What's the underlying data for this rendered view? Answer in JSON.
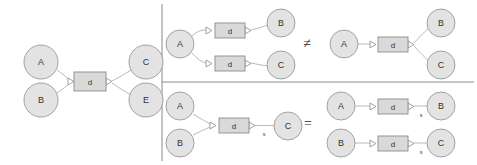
{
  "figure": {
    "background_color": "#ffffff",
    "node_fill": "#e3e3e3",
    "node_stroke": "#9a9a9a",
    "box_fill": "#d9d9d9",
    "box_stroke": "#8c8c8c",
    "edge_stroke": "#a8a8a8"
  },
  "dividers": {
    "vertical_label": "panel-divider-vertical",
    "horizontal_label": "panel-divider-horizontal"
  },
  "panels": [
    {
      "id": "left-panel",
      "name": "many-to-many-hyperedge",
      "nodes": [
        {
          "id": "l-a",
          "label": "A",
          "cx": 41,
          "cy": 62,
          "r": 17
        },
        {
          "id": "l-b",
          "label": "B",
          "cx": 41,
          "cy": 100,
          "r": 17
        },
        {
          "id": "l-c",
          "label": "C",
          "cx": 146,
          "cy": 62,
          "r": 17
        },
        {
          "id": "l-e",
          "label": "E",
          "cx": 146,
          "cy": 100,
          "r": 17
        }
      ],
      "boxes": [
        {
          "id": "l-d",
          "label": "d",
          "x": 74,
          "y": 72,
          "w": 32,
          "h": 19
        }
      ],
      "edges": [
        {
          "id": "l-e1",
          "from": "l-a",
          "to": "l-d",
          "label": ""
        },
        {
          "id": "l-e2",
          "from": "l-b",
          "to": "l-d",
          "label": ""
        },
        {
          "id": "l-e3",
          "from": "l-d",
          "to": "l-c",
          "label": ""
        },
        {
          "id": "l-e4",
          "from": "l-d",
          "to": "l-e",
          "label": ""
        }
      ]
    },
    {
      "id": "top-middle-panel",
      "name": "two-separate-hyperedges",
      "nodes": [
        {
          "id": "tm-a",
          "label": "A",
          "cx": 180,
          "cy": 44,
          "r": 14
        },
        {
          "id": "tm-b",
          "label": "B",
          "cx": 281,
          "cy": 23,
          "r": 14
        },
        {
          "id": "tm-c",
          "label": "C",
          "cx": 281,
          "cy": 65,
          "r": 14
        }
      ],
      "boxes": [
        {
          "id": "tm-d1",
          "label": "d",
          "x": 215,
          "y": 23,
          "w": 30,
          "h": 15
        },
        {
          "id": "tm-d2",
          "label": "d",
          "x": 215,
          "y": 56,
          "w": 30,
          "h": 15
        }
      ],
      "edges": [
        {
          "id": "tm-e1",
          "from": "tm-a",
          "to": "tm-d1",
          "label": ""
        },
        {
          "id": "tm-e2",
          "from": "tm-d1",
          "to": "tm-b",
          "label": ""
        },
        {
          "id": "tm-e3",
          "from": "tm-a",
          "to": "tm-d2",
          "label": ""
        },
        {
          "id": "tm-e4",
          "from": "tm-d2",
          "to": "tm-c",
          "label": ""
        }
      ]
    },
    {
      "id": "top-right-panel",
      "name": "single-hyperedge-two-outputs",
      "nodes": [
        {
          "id": "tr-a",
          "label": "A",
          "cx": 344,
          "cy": 44,
          "r": 14
        },
        {
          "id": "tr-b",
          "label": "B",
          "cx": 441,
          "cy": 23,
          "r": 14
        },
        {
          "id": "tr-c",
          "label": "C",
          "cx": 441,
          "cy": 65,
          "r": 14
        }
      ],
      "boxes": [
        {
          "id": "tr-d",
          "label": "d",
          "x": 378,
          "y": 37,
          "w": 30,
          "h": 15
        }
      ],
      "edges": [
        {
          "id": "tr-e1",
          "from": "tr-a",
          "to": "tr-d",
          "label": ""
        },
        {
          "id": "tr-e2",
          "from": "tr-d",
          "to": "tr-b",
          "label": ""
        },
        {
          "id": "tr-e3",
          "from": "tr-d",
          "to": "tr-c",
          "label": ""
        }
      ]
    },
    {
      "id": "bottom-middle-panel",
      "name": "merged-inputs-single-output",
      "nodes": [
        {
          "id": "bm-a",
          "label": "A",
          "cx": 180,
          "cy": 106,
          "r": 14
        },
        {
          "id": "bm-b",
          "label": "B",
          "cx": 180,
          "cy": 143,
          "r": 14
        },
        {
          "id": "bm-c",
          "label": "C",
          "cx": 288,
          "cy": 126,
          "r": 14
        }
      ],
      "boxes": [
        {
          "id": "bm-d",
          "label": "d",
          "x": 219,
          "y": 118,
          "w": 30,
          "h": 15
        }
      ],
      "edges": [
        {
          "id": "bm-e1",
          "from": "bm-a",
          "to": "bm-d",
          "label": ""
        },
        {
          "id": "bm-e2",
          "from": "bm-b",
          "to": "bm-d",
          "label": ""
        },
        {
          "id": "bm-e3",
          "from": "bm-d",
          "to": "bm-c",
          "label": "s"
        }
      ]
    },
    {
      "id": "bottom-right-panel",
      "name": "two-independent-chains",
      "nodes": [
        {
          "id": "br-a",
          "label": "A",
          "cx": 341,
          "cy": 106,
          "r": 14
        },
        {
          "id": "br-b1",
          "label": "B",
          "cx": 441,
          "cy": 106,
          "r": 14
        },
        {
          "id": "br-b2",
          "label": "B",
          "cx": 341,
          "cy": 143,
          "r": 14
        },
        {
          "id": "br-c",
          "label": "C",
          "cx": 441,
          "cy": 143,
          "r": 14
        }
      ],
      "boxes": [
        {
          "id": "br-d1",
          "label": "d",
          "x": 378,
          "y": 99,
          "w": 30,
          "h": 15
        },
        {
          "id": "br-d2",
          "label": "d",
          "x": 378,
          "y": 136,
          "w": 30,
          "h": 15
        }
      ],
      "edges": [
        {
          "id": "br-e1",
          "from": "br-a",
          "to": "br-d1",
          "label": ""
        },
        {
          "id": "br-e2",
          "from": "br-d1",
          "to": "br-b1",
          "label": "s"
        },
        {
          "id": "br-e3",
          "from": "br-b2",
          "to": "br-d2",
          "label": ""
        },
        {
          "id": "br-e4",
          "from": "br-d2",
          "to": "br-c",
          "label": "s"
        }
      ]
    }
  ],
  "relations": [
    {
      "id": "rel-top",
      "symbol": "≠",
      "name": "not-equal-symbol",
      "x": 307,
      "y": 43
    },
    {
      "id": "rel-bottom",
      "symbol": "=",
      "name": "equal-symbol",
      "x": 308,
      "y": 123
    }
  ],
  "edge_labels": {
    "s": "s"
  }
}
